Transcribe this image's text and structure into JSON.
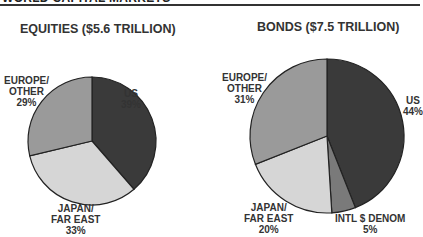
{
  "header": {
    "title": "WORLD CAPITAL MARKETS"
  },
  "colors": {
    "us": "#3a3a3a",
    "japan": "#d6d6d6",
    "europe": "#9a9a9a",
    "intl": "#7a7a7a",
    "outline": "#222222"
  },
  "chart_data": [
    {
      "type": "pie",
      "title": "EQUITIES ($5.6 TRILLION)",
      "categories": [
        "US",
        "JAPAN/FAR EAST",
        "EUROPE/OTHER"
      ],
      "values": [
        39,
        33,
        29
      ],
      "unit": "%"
    },
    {
      "type": "pie",
      "title": "BONDS ($7.5 TRILLION)",
      "categories": [
        "US",
        "INTL $ DENOM",
        "JAPAN/FAR EAST",
        "EUROPE/OTHER"
      ],
      "values": [
        44,
        5,
        20,
        31
      ],
      "unit": "%"
    }
  ],
  "labels": {
    "eq": {
      "us": [
        "US",
        "39%"
      ],
      "japan": [
        "JAPAN/",
        "FAR EAST",
        "33%"
      ],
      "europe": [
        "EUROPE/",
        "OTHER",
        "29%"
      ]
    },
    "bd": {
      "us": [
        "US",
        "44%"
      ],
      "intl": [
        "INTL $ DENOM",
        "5%"
      ],
      "japan": [
        "JAPAN/",
        "FAR EAST",
        "20%"
      ],
      "europe": [
        "EUROPE/",
        "OTHER",
        "31%"
      ]
    }
  }
}
